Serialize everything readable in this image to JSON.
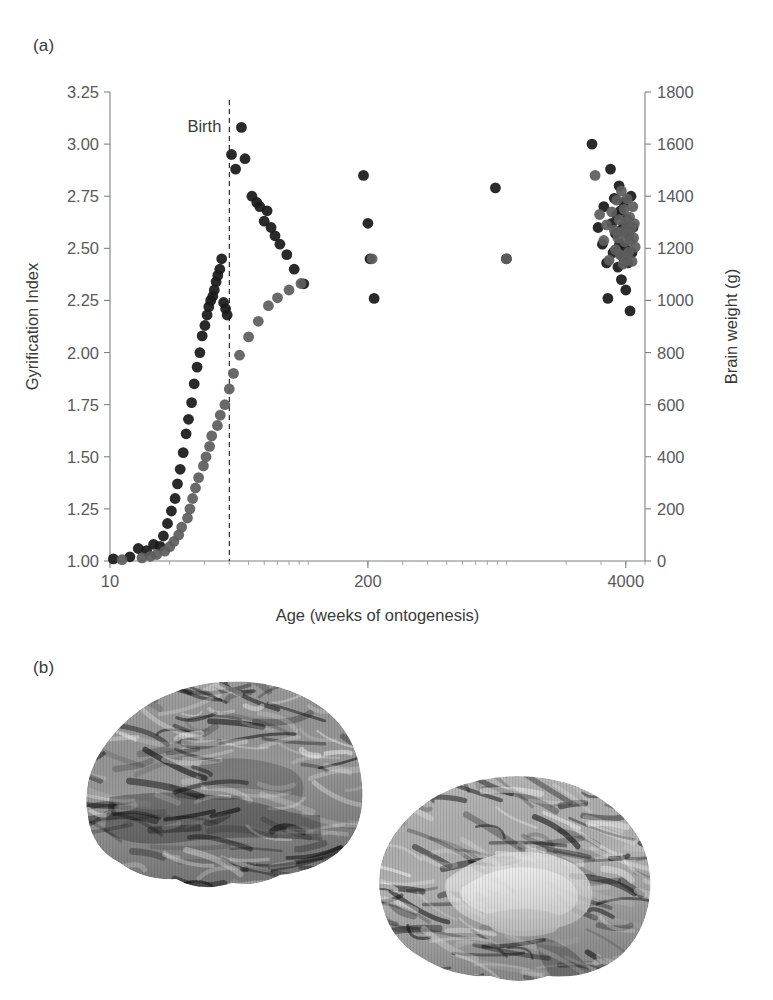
{
  "figure": {
    "panel_a_label": "(a)",
    "panel_b_label": "(b)"
  },
  "panel_b": {
    "images": [
      {
        "name": "brain-lateral-view",
        "caption": ""
      },
      {
        "name": "brain-medial-view",
        "caption": ""
      }
    ]
  },
  "chart_data": {
    "type": "scatter",
    "title": "",
    "xlabel": "Age (weeks of ontogenesis)",
    "ylabel": "Gyrification Index",
    "y2label": "Brain weight (g)",
    "xscale": "log",
    "xlim": [
      10,
      5000
    ],
    "xticks": [
      10,
      200,
      4000
    ],
    "xticklabels": [
      "10",
      "200",
      "4000"
    ],
    "ylim": [
      1.0,
      3.25
    ],
    "yticks": [
      1.0,
      1.25,
      1.5,
      1.75,
      2.0,
      2.25,
      2.5,
      2.75,
      3.0,
      3.25
    ],
    "yticklabels": [
      "1.00",
      "1.25",
      "1.50",
      "1.75",
      "2.00",
      "2.25",
      "2.50",
      "2.75",
      "3.00",
      "3.25"
    ],
    "y2lim": [
      0,
      1800
    ],
    "y2ticks": [
      0,
      200,
      400,
      600,
      800,
      1000,
      1200,
      1400,
      1600,
      1800
    ],
    "y2ticklabels": [
      "0",
      "200",
      "400",
      "600",
      "800",
      "1000",
      "1200",
      "1400",
      "1600",
      "1800"
    ],
    "grid": false,
    "legend": "none",
    "annotations": [
      {
        "text": "Birth",
        "x": 40,
        "kind": "vertical-dashed-line",
        "label_position": "left-of-line"
      }
    ],
    "colors": {
      "gyrification_index": "#1a1a1a",
      "brain_weight": "#5e5e5e",
      "axis": "#7f8083",
      "text": "#3a3a3a"
    },
    "series": [
      {
        "name": "Gyrification Index",
        "axis": "left",
        "color": "#1a1a1a",
        "points": [
          [
            10.4,
            1.01
          ],
          [
            12.6,
            1.02
          ],
          [
            13.9,
            1.06
          ],
          [
            15.3,
            1.05
          ],
          [
            16.6,
            1.08
          ],
          [
            17.9,
            1.07
          ],
          [
            18.6,
            1.12
          ],
          [
            19.5,
            1.18
          ],
          [
            20.4,
            1.24
          ],
          [
            21.3,
            1.3
          ],
          [
            21.9,
            1.37
          ],
          [
            22.6,
            1.44
          ],
          [
            23.4,
            1.52
          ],
          [
            24.2,
            1.61
          ],
          [
            24.9,
            1.68
          ],
          [
            25.8,
            1.76
          ],
          [
            26.6,
            1.85
          ],
          [
            27.5,
            1.93
          ],
          [
            28.4,
            2.0
          ],
          [
            29.2,
            2.08
          ],
          [
            30.1,
            2.13
          ],
          [
            30.9,
            2.18
          ],
          [
            31.5,
            2.22
          ],
          [
            32.2,
            2.25
          ],
          [
            33.0,
            2.27
          ],
          [
            33.6,
            2.3
          ],
          [
            34.3,
            2.34
          ],
          [
            35.0,
            2.37
          ],
          [
            35.8,
            2.4
          ],
          [
            36.6,
            2.45
          ],
          [
            37.4,
            2.24
          ],
          [
            38.3,
            2.21
          ],
          [
            39.0,
            2.18
          ],
          [
            41.0,
            2.95
          ],
          [
            43.0,
            2.88
          ],
          [
            46.0,
            3.08
          ],
          [
            48.0,
            2.93
          ],
          [
            52.0,
            2.75
          ],
          [
            55.0,
            2.72
          ],
          [
            57.0,
            2.7
          ],
          [
            60.0,
            2.63
          ],
          [
            62.0,
            2.68
          ],
          [
            65.0,
            2.6
          ],
          [
            68.0,
            2.56
          ],
          [
            72.0,
            2.52
          ],
          [
            78.0,
            2.47
          ],
          [
            85.0,
            2.4
          ],
          [
            95.0,
            2.33
          ],
          [
            190.0,
            2.85
          ],
          [
            200.0,
            2.62
          ],
          [
            205.0,
            2.45
          ],
          [
            215.0,
            2.26
          ],
          [
            880.0,
            2.79
          ],
          [
            1000.0,
            2.45
          ],
          [
            2700.0,
            3.0
          ],
          [
            2900.0,
            2.6
          ],
          [
            3050.0,
            2.52
          ],
          [
            3100.0,
            2.7
          ],
          [
            3200.0,
            2.43
          ],
          [
            3250.0,
            2.26
          ],
          [
            3350.0,
            2.88
          ],
          [
            3400.0,
            2.62
          ],
          [
            3450.0,
            2.48
          ],
          [
            3500.0,
            2.74
          ],
          [
            3550.0,
            2.57
          ],
          [
            3600.0,
            2.66
          ],
          [
            3650.0,
            2.41
          ],
          [
            3700.0,
            2.8
          ],
          [
            3720.0,
            2.52
          ],
          [
            3760.0,
            2.68
          ],
          [
            3800.0,
            2.35
          ],
          [
            3820.0,
            2.59
          ],
          [
            3860.0,
            2.46
          ],
          [
            3900.0,
            2.72
          ],
          [
            3920.0,
            2.61
          ],
          [
            3960.0,
            2.5
          ],
          [
            4000.0,
            2.3
          ],
          [
            4050.0,
            2.64
          ],
          [
            4100.0,
            2.43
          ],
          [
            4150.0,
            2.56
          ],
          [
            4200.0,
            2.2
          ],
          [
            4250.0,
            2.75
          ],
          [
            4300.0,
            2.48
          ],
          [
            4350.0,
            2.6
          ]
        ]
      },
      {
        "name": "Brain weight",
        "axis": "right",
        "color": "#5e5e5e",
        "points": [
          [
            11.5,
            5
          ],
          [
            14.5,
            12
          ],
          [
            16.0,
            18
          ],
          [
            17.2,
            25
          ],
          [
            18.9,
            38
          ],
          [
            20.0,
            55
          ],
          [
            21.0,
            75
          ],
          [
            22.2,
            100
          ],
          [
            23.0,
            130
          ],
          [
            24.6,
            165
          ],
          [
            25.3,
            200
          ],
          [
            26.1,
            240
          ],
          [
            27.0,
            280
          ],
          [
            28.0,
            320
          ],
          [
            29.6,
            365
          ],
          [
            30.5,
            400
          ],
          [
            31.8,
            440
          ],
          [
            32.6,
            480
          ],
          [
            34.8,
            520
          ],
          [
            36.0,
            560
          ],
          [
            38.0,
            600
          ],
          [
            40.0,
            660
          ],
          [
            42.0,
            720
          ],
          [
            45.0,
            790
          ],
          [
            50.0,
            860
          ],
          [
            56.0,
            920
          ],
          [
            63.0,
            980
          ],
          [
            70.0,
            1010
          ],
          [
            80.0,
            1040
          ],
          [
            92.0,
            1065
          ],
          [
            210.0,
            1160
          ],
          [
            1000.0,
            1160
          ],
          [
            2800.0,
            1480
          ],
          [
            2950.0,
            1330
          ],
          [
            3100.0,
            1230
          ],
          [
            3200.0,
            1290
          ],
          [
            3300.0,
            1155
          ],
          [
            3400.0,
            1340
          ],
          [
            3500.0,
            1270
          ],
          [
            3550.0,
            1195
          ],
          [
            3600.0,
            1385
          ],
          [
            3650.0,
            1240
          ],
          [
            3700.0,
            1310
          ],
          [
            3750.0,
            1175
          ],
          [
            3800.0,
            1420
          ],
          [
            3850.0,
            1265
          ],
          [
            3880.0,
            1140
          ],
          [
            3920.0,
            1350
          ],
          [
            3950.0,
            1225
          ],
          [
            3980.0,
            1300
          ],
          [
            4020.0,
            1160
          ],
          [
            4060.0,
            1390
          ],
          [
            4100.0,
            1255
          ],
          [
            4140.0,
            1185
          ],
          [
            4180.0,
            1320
          ],
          [
            4220.0,
            1230
          ],
          [
            4260.0,
            1275
          ],
          [
            4300.0,
            1150
          ],
          [
            4340.0,
            1360
          ],
          [
            4380.0,
            1240
          ],
          [
            4420.0,
            1295
          ],
          [
            4460.0,
            1205
          ]
        ]
      }
    ]
  }
}
